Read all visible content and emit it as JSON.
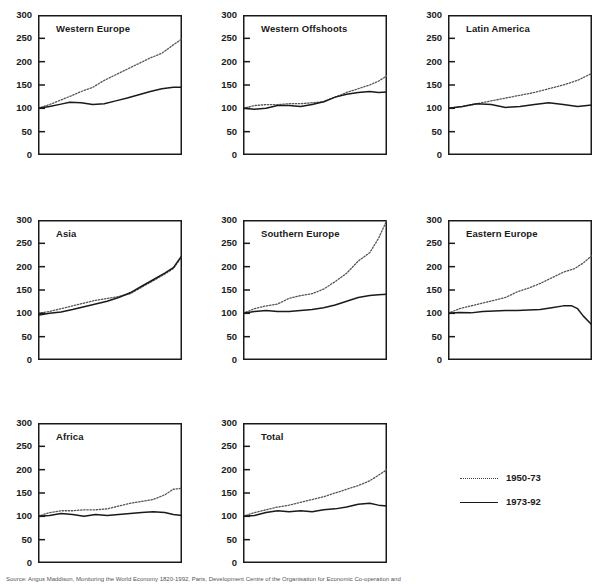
{
  "figure": {
    "caption": "Source: Angus Maddison, Monitoring the World Economy 1820-1992, Paris, Development Centre of the Organisation for Economic Co-operation and"
  },
  "legend": {
    "position": "bottom-right",
    "entries": [
      {
        "label": "1950-73",
        "style": "dotted",
        "color": "#444444"
      },
      {
        "label": "1973-92",
        "style": "solid",
        "color": "#1a1a1a"
      }
    ]
  },
  "axis": {
    "ytick_labels": [
      "300",
      "250",
      "200",
      "150",
      "100",
      "50",
      "0"
    ],
    "ymin": 0,
    "ymax": 300
  },
  "chart_data": {
    "type": "line",
    "title": "",
    "xlabel": "",
    "ylabel": "",
    "ylim": [
      0,
      300
    ],
    "yticks": [
      0,
      50,
      100,
      150,
      200,
      250,
      300
    ],
    "grid": false,
    "legend_position": "bottom-right",
    "panels": [
      {
        "title": "Western Europe",
        "series": [
          {
            "name": "1950-73",
            "style": "dotted",
            "x": [
              0,
              0.08,
              0.16,
              0.24,
              0.3,
              0.38,
              0.46,
              0.54,
              0.62,
              0.7,
              0.78,
              0.86,
              0.94,
              1.0
            ],
            "values": [
              100,
              108,
              118,
              128,
              136,
              145,
              160,
              172,
              184,
              196,
              208,
              218,
              236,
              249
            ]
          },
          {
            "name": "1973-92",
            "style": "solid",
            "x": [
              0,
              0.08,
              0.16,
              0.22,
              0.3,
              0.38,
              0.46,
              0.54,
              0.62,
              0.7,
              0.78,
              0.86,
              0.94,
              1.0
            ],
            "values": [
              100,
              104,
              109,
              113,
              112,
              108,
              110,
              116,
              122,
              129,
              136,
              142,
              145,
              145
            ]
          }
        ]
      },
      {
        "title": "Western Offshoots",
        "series": [
          {
            "name": "1950-73",
            "style": "dotted",
            "x": [
              0,
              0.08,
              0.16,
              0.24,
              0.32,
              0.4,
              0.48,
              0.56,
              0.64,
              0.72,
              0.8,
              0.88,
              0.94,
              1.0
            ],
            "values": [
              100,
              106,
              108,
              108,
              110,
              110,
              112,
              114,
              124,
              134,
              142,
              150,
              158,
              170
            ]
          },
          {
            "name": "1973-92",
            "style": "solid",
            "x": [
              0,
              0.08,
              0.16,
              0.24,
              0.32,
              0.4,
              0.48,
              0.56,
              0.64,
              0.72,
              0.8,
              0.88,
              0.94,
              1.0
            ],
            "values": [
              100,
              98,
              100,
              106,
              106,
              104,
              108,
              114,
              124,
              130,
              134,
              136,
              134,
              135
            ]
          }
        ]
      },
      {
        "title": "Latin America",
        "series": [
          {
            "name": "1950-73",
            "style": "dotted",
            "x": [
              0,
              0.1,
              0.2,
              0.3,
              0.4,
              0.5,
              0.6,
              0.7,
              0.8,
              0.9,
              1.0
            ],
            "values": [
              100,
              104,
              110,
              116,
              122,
              128,
              134,
              142,
              150,
              160,
              175
            ]
          },
          {
            "name": "1973-92",
            "style": "solid",
            "x": [
              0,
              0.1,
              0.2,
              0.3,
              0.4,
              0.5,
              0.6,
              0.7,
              0.8,
              0.9,
              1.0
            ],
            "values": [
              100,
              104,
              110,
              108,
              102,
              104,
              108,
              112,
              108,
              104,
              107
            ]
          }
        ]
      },
      {
        "title": "Asia",
        "series": [
          {
            "name": "1950-73",
            "style": "dotted",
            "x": [
              0,
              0.08,
              0.16,
              0.24,
              0.32,
              0.4,
              0.48,
              0.56,
              0.64,
              0.72,
              0.8,
              0.88,
              0.94,
              1.0
            ],
            "values": [
              100,
              104,
              110,
              116,
              122,
              128,
              132,
              136,
              142,
              156,
              170,
              184,
              196,
              222
            ]
          },
          {
            "name": "1973-92",
            "style": "solid",
            "x": [
              0,
              0.08,
              0.16,
              0.24,
              0.32,
              0.4,
              0.48,
              0.56,
              0.64,
              0.72,
              0.8,
              0.88,
              0.94,
              1.0
            ],
            "values": [
              96,
              100,
              103,
              108,
              114,
              120,
              126,
              134,
              144,
              158,
              172,
              186,
              198,
              224
            ]
          }
        ]
      },
      {
        "title": "Southern Europe",
        "series": [
          {
            "name": "1950-73",
            "style": "dotted",
            "x": [
              0,
              0.08,
              0.16,
              0.24,
              0.32,
              0.4,
              0.48,
              0.56,
              0.64,
              0.72,
              0.8,
              0.88,
              0.94,
              1.0
            ],
            "values": [
              100,
              110,
              116,
              120,
              132,
              138,
              142,
              152,
              168,
              186,
              212,
              230,
              260,
              300
            ]
          },
          {
            "name": "1973-92",
            "style": "solid",
            "x": [
              0,
              0.08,
              0.16,
              0.24,
              0.32,
              0.4,
              0.48,
              0.56,
              0.64,
              0.72,
              0.8,
              0.88,
              0.94,
              1.0
            ],
            "values": [
              100,
              104,
              106,
              104,
              104,
              106,
              108,
              112,
              118,
              126,
              134,
              138,
              140,
              141
            ]
          }
        ]
      },
      {
        "title": "Eastern Europe",
        "series": [
          {
            "name": "1950-73",
            "style": "dotted",
            "x": [
              0,
              0.08,
              0.16,
              0.24,
              0.32,
              0.4,
              0.48,
              0.56,
              0.64,
              0.72,
              0.8,
              0.88,
              0.94,
              1.0
            ],
            "values": [
              100,
              110,
              116,
              122,
              128,
              134,
              146,
              154,
              164,
              176,
              188,
              196,
              208,
              224
            ]
          },
          {
            "name": "1973-92",
            "style": "solid",
            "x": [
              0,
              0.08,
              0.16,
              0.24,
              0.32,
              0.4,
              0.48,
              0.56,
              0.64,
              0.72,
              0.8,
              0.86,
              0.9,
              0.94,
              1.0
            ],
            "values": [
              100,
              102,
              101,
              104,
              105,
              106,
              106,
              107,
              108,
              112,
              116,
              116,
              110,
              94,
              75
            ]
          }
        ]
      },
      {
        "title": "Africa",
        "series": [
          {
            "name": "1950-73",
            "style": "dotted",
            "x": [
              0,
              0.08,
              0.16,
              0.24,
              0.32,
              0.4,
              0.48,
              0.56,
              0.64,
              0.72,
              0.8,
              0.88,
              0.94,
              1.0
            ],
            "values": [
              100,
              108,
              112,
              112,
              114,
              114,
              116,
              122,
              128,
              132,
              136,
              146,
              158,
              160
            ]
          },
          {
            "name": "1973-92",
            "style": "solid",
            "x": [
              0,
              0.08,
              0.16,
              0.24,
              0.32,
              0.4,
              0.48,
              0.56,
              0.64,
              0.72,
              0.8,
              0.88,
              0.94,
              1.0
            ],
            "values": [
              100,
              102,
              106,
              104,
              100,
              104,
              102,
              104,
              106,
              108,
              110,
              108,
              104,
              102
            ]
          }
        ]
      },
      {
        "title": "Total",
        "series": [
          {
            "name": "1950-73",
            "style": "dotted",
            "x": [
              0,
              0.08,
              0.16,
              0.24,
              0.32,
              0.4,
              0.48,
              0.56,
              0.64,
              0.72,
              0.8,
              0.88,
              0.94,
              1.0
            ],
            "values": [
              100,
              108,
              114,
              120,
              124,
              130,
              136,
              142,
              150,
              158,
              166,
              176,
              188,
              200
            ]
          },
          {
            "name": "1973-92",
            "style": "solid",
            "x": [
              0,
              0.08,
              0.16,
              0.24,
              0.32,
              0.4,
              0.48,
              0.56,
              0.64,
              0.72,
              0.8,
              0.88,
              0.94,
              1.0
            ],
            "values": [
              100,
              102,
              108,
              112,
              110,
              112,
              110,
              114,
              116,
              120,
              126,
              128,
              124,
              122
            ]
          }
        ]
      }
    ]
  }
}
